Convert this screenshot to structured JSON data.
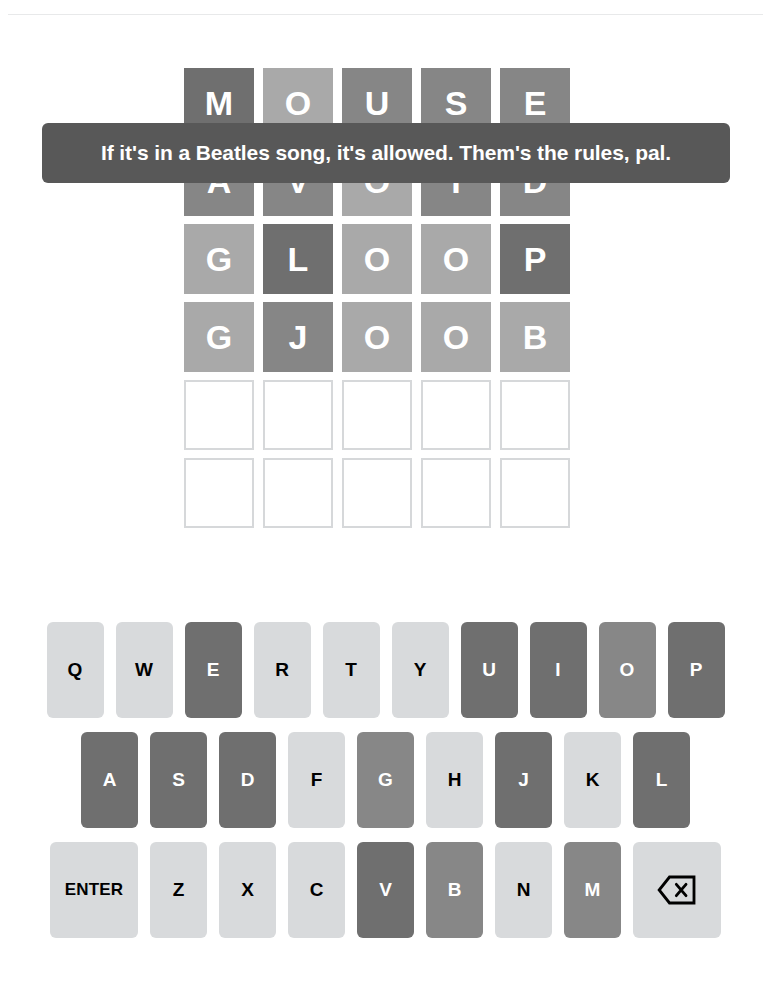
{
  "colors": {
    "absent": "#6f6f6f",
    "present": "#a9a9a9",
    "correct": "#878787",
    "unused_key": "#d8dadc",
    "empty_tile_border": "#d6d8da",
    "toast_background": "#585858",
    "toast_text": "#ffffff",
    "page_background": "#ffffff",
    "divider": "#e8e9ea"
  },
  "toast": {
    "message": "If it's in a Beatles song, it's allowed. Them's the rules, pal."
  },
  "board": {
    "rows": 6,
    "columns": 5,
    "guesses": [
      {
        "word": "MOUSE",
        "tiles": [
          {
            "letter": "M",
            "state": "correct"
          },
          {
            "letter": "O",
            "state": "present"
          },
          {
            "letter": "U",
            "state": "absent"
          },
          {
            "letter": "S",
            "state": "absent"
          },
          {
            "letter": "E",
            "state": "absent"
          }
        ]
      },
      {
        "word": "AVOID",
        "tiles": [
          {
            "letter": "A",
            "state": "absent"
          },
          {
            "letter": "V",
            "state": "absent"
          },
          {
            "letter": "O",
            "state": "present"
          },
          {
            "letter": "I",
            "state": "absent"
          },
          {
            "letter": "D",
            "state": "absent"
          }
        ]
      },
      {
        "word": "GLOOP",
        "tiles": [
          {
            "letter": "G",
            "state": "present"
          },
          {
            "letter": "L",
            "state": "correct"
          },
          {
            "letter": "O",
            "state": "present"
          },
          {
            "letter": "O",
            "state": "present"
          },
          {
            "letter": "P",
            "state": "correct"
          }
        ]
      },
      {
        "word": "GJOOB",
        "tiles": [
          {
            "letter": "G",
            "state": "present"
          },
          {
            "letter": "J",
            "state": "absent"
          },
          {
            "letter": "O",
            "state": "present"
          },
          {
            "letter": "O",
            "state": "present"
          },
          {
            "letter": "B",
            "state": "present"
          }
        ]
      }
    ],
    "empty_rows": 2
  },
  "keyboard": {
    "rows": [
      [
        {
          "label": "Q",
          "name": "key-q",
          "state": "unused"
        },
        {
          "label": "W",
          "name": "key-w",
          "state": "unused"
        },
        {
          "label": "E",
          "name": "key-e",
          "state": "absent"
        },
        {
          "label": "R",
          "name": "key-r",
          "state": "unused"
        },
        {
          "label": "T",
          "name": "key-t",
          "state": "unused"
        },
        {
          "label": "Y",
          "name": "key-y",
          "state": "unused"
        },
        {
          "label": "U",
          "name": "key-u",
          "state": "absent"
        },
        {
          "label": "I",
          "name": "key-i",
          "state": "absent"
        },
        {
          "label": "O",
          "name": "key-o",
          "state": "correct"
        },
        {
          "label": "P",
          "name": "key-p",
          "state": "absent"
        }
      ],
      [
        {
          "label": "A",
          "name": "key-a",
          "state": "absent"
        },
        {
          "label": "S",
          "name": "key-s",
          "state": "absent"
        },
        {
          "label": "D",
          "name": "key-d",
          "state": "absent"
        },
        {
          "label": "F",
          "name": "key-f",
          "state": "unused"
        },
        {
          "label": "G",
          "name": "key-g",
          "state": "correct"
        },
        {
          "label": "H",
          "name": "key-h",
          "state": "unused"
        },
        {
          "label": "J",
          "name": "key-j",
          "state": "absent"
        },
        {
          "label": "K",
          "name": "key-k",
          "state": "unused"
        },
        {
          "label": "L",
          "name": "key-l",
          "state": "absent"
        }
      ],
      [
        {
          "label": "ENTER",
          "name": "key-enter",
          "state": "unused",
          "wide": true
        },
        {
          "label": "Z",
          "name": "key-z",
          "state": "unused"
        },
        {
          "label": "X",
          "name": "key-x",
          "state": "unused"
        },
        {
          "label": "C",
          "name": "key-c",
          "state": "unused"
        },
        {
          "label": "V",
          "name": "key-v",
          "state": "absent"
        },
        {
          "label": "B",
          "name": "key-b",
          "state": "correct"
        },
        {
          "label": "N",
          "name": "key-n",
          "state": "unused"
        },
        {
          "label": "M",
          "name": "key-m",
          "state": "correct"
        },
        {
          "label": "",
          "name": "key-backspace",
          "state": "unused",
          "wide": true,
          "icon": "backspace-icon"
        }
      ]
    ]
  }
}
